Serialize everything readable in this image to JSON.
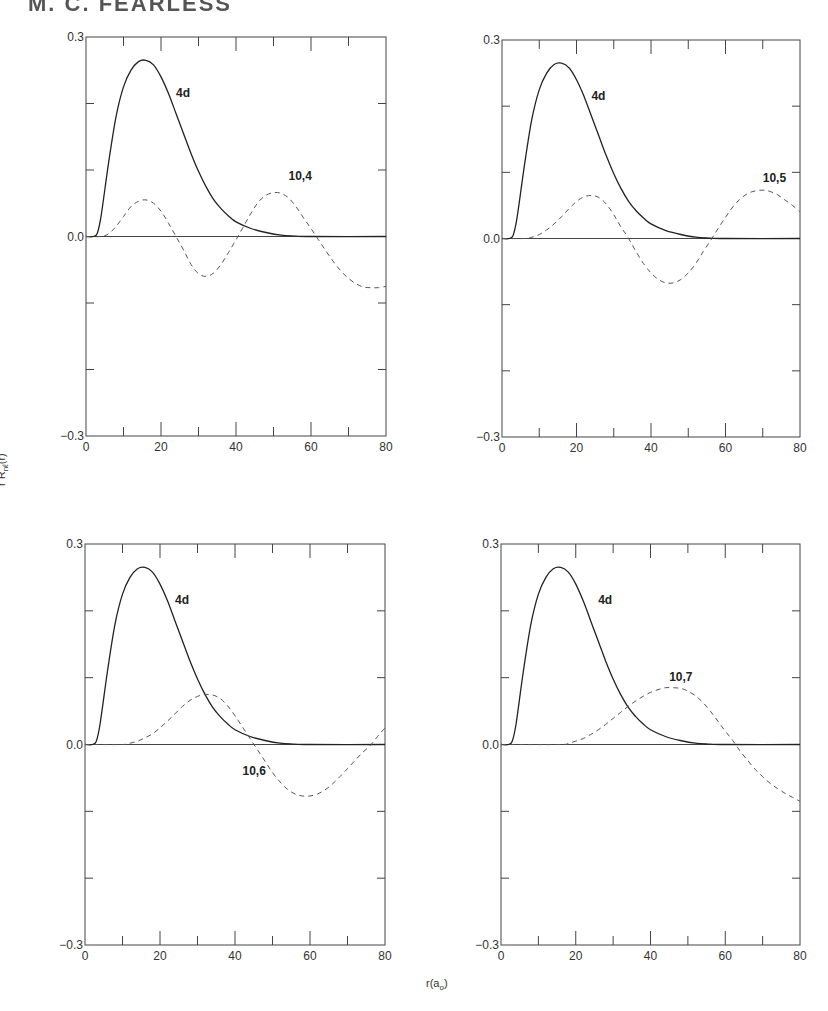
{
  "page": {
    "header_cropped_text": "M. C. FEARLESS"
  },
  "axes": {
    "ylabel": "r R",
    "ylabel_sub": "nℓ",
    "ylabel_tail": "(r)",
    "xlabel": "r(a",
    "xlabel_sub": "o",
    "xlabel_tail": ")"
  },
  "chart_data": [
    {
      "type": "line",
      "panel": "top-left",
      "xlabel": "r(a_o)",
      "ylabel": "r R_nl(r)",
      "xlim": [
        0,
        80
      ],
      "ylim": [
        -0.3,
        0.3
      ],
      "xticks": [
        0,
        20,
        40,
        60,
        80
      ],
      "yticks": [
        -0.3,
        0.0,
        0.3
      ],
      "series": [
        {
          "name": "4d",
          "style": "solid",
          "x": [
            0,
            2,
            3,
            4,
            6,
            8,
            10,
            12,
            14,
            16,
            18,
            20,
            22,
            24,
            26,
            28,
            30,
            32,
            34,
            36,
            38,
            40,
            44,
            48,
            52,
            56,
            60,
            80
          ],
          "y": [
            0,
            0,
            0.005,
            0.03,
            0.11,
            0.18,
            0.225,
            0.25,
            0.263,
            0.265,
            0.258,
            0.24,
            0.215,
            0.185,
            0.155,
            0.125,
            0.098,
            0.075,
            0.056,
            0.042,
            0.031,
            0.022,
            0.012,
            0.006,
            0.002,
            0.0005,
            0,
            0
          ]
        },
        {
          "name": "10,4",
          "style": "dashed",
          "x": [
            0,
            4,
            6,
            8,
            10,
            12,
            14,
            16,
            18,
            20,
            22,
            24,
            26,
            28,
            30,
            32,
            34,
            36,
            38,
            40,
            42,
            44,
            46,
            48,
            50,
            52,
            54,
            56,
            58,
            60,
            62,
            64,
            66,
            68,
            70,
            72,
            74,
            76,
            78,
            80
          ],
          "y": [
            0,
            0,
            0.004,
            0.015,
            0.03,
            0.045,
            0.053,
            0.055,
            0.05,
            0.038,
            0.02,
            0,
            -0.02,
            -0.042,
            -0.056,
            -0.06,
            -0.055,
            -0.042,
            -0.024,
            -0.005,
            0.015,
            0.035,
            0.052,
            0.062,
            0.066,
            0.065,
            0.058,
            0.045,
            0.028,
            0.012,
            -0.005,
            -0.022,
            -0.038,
            -0.052,
            -0.063,
            -0.071,
            -0.076,
            -0.077,
            -0.077,
            -0.075
          ]
        }
      ],
      "annotations": [
        {
          "text": "4d",
          "x": 24,
          "y": 0.21
        },
        {
          "text": "10,4",
          "x": 54,
          "y": 0.085
        }
      ]
    },
    {
      "type": "line",
      "panel": "top-right",
      "xlim": [
        0,
        80
      ],
      "ylim": [
        -0.3,
        0.3
      ],
      "xticks": [
        0,
        20,
        40,
        60,
        80
      ],
      "yticks": [
        -0.3,
        0.0,
        0.3
      ],
      "series": [
        {
          "name": "4d",
          "style": "solid",
          "x": [
            0,
            2,
            3,
            4,
            6,
            8,
            10,
            12,
            14,
            16,
            18,
            20,
            22,
            24,
            26,
            28,
            30,
            32,
            34,
            36,
            38,
            40,
            44,
            48,
            52,
            56,
            60,
            80
          ],
          "y": [
            0,
            0,
            0.005,
            0.03,
            0.11,
            0.18,
            0.225,
            0.25,
            0.263,
            0.265,
            0.258,
            0.24,
            0.215,
            0.185,
            0.155,
            0.125,
            0.098,
            0.075,
            0.056,
            0.042,
            0.031,
            0.022,
            0.012,
            0.006,
            0.002,
            0.0005,
            0,
            0
          ]
        },
        {
          "name": "10,5",
          "style": "dashed",
          "x": [
            0,
            6,
            8,
            10,
            12,
            14,
            16,
            18,
            20,
            22,
            24,
            26,
            28,
            30,
            32,
            34,
            36,
            38,
            40,
            42,
            44,
            46,
            48,
            50,
            52,
            54,
            56,
            58,
            60,
            62,
            64,
            66,
            68,
            70,
            72,
            74,
            76,
            78,
            80
          ],
          "y": [
            0,
            0,
            0.002,
            0.006,
            0.013,
            0.022,
            0.033,
            0.045,
            0.056,
            0.063,
            0.065,
            0.062,
            0.052,
            0.036,
            0.017,
            0,
            -0.02,
            -0.038,
            -0.052,
            -0.062,
            -0.067,
            -0.067,
            -0.062,
            -0.052,
            -0.038,
            -0.02,
            -0.003,
            0.015,
            0.032,
            0.048,
            0.06,
            0.068,
            0.072,
            0.073,
            0.071,
            0.066,
            0.058,
            0.05,
            0.04
          ]
        }
      ],
      "annotations": [
        {
          "text": "4d",
          "x": 24,
          "y": 0.21
        },
        {
          "text": "10,5",
          "x": 70,
          "y": 0.085
        }
      ]
    },
    {
      "type": "line",
      "panel": "bottom-left",
      "xlim": [
        0,
        80
      ],
      "ylim": [
        -0.3,
        0.3
      ],
      "xticks": [
        0,
        20,
        40,
        60,
        80
      ],
      "yticks": [
        -0.3,
        0.0,
        0.3
      ],
      "series": [
        {
          "name": "4d",
          "style": "solid",
          "x": [
            0,
            2,
            3,
            4,
            6,
            8,
            10,
            12,
            14,
            16,
            18,
            20,
            22,
            24,
            26,
            28,
            30,
            32,
            34,
            36,
            38,
            40,
            44,
            48,
            52,
            56,
            60,
            80
          ],
          "y": [
            0,
            0,
            0.005,
            0.03,
            0.11,
            0.18,
            0.225,
            0.25,
            0.263,
            0.265,
            0.258,
            0.24,
            0.215,
            0.185,
            0.155,
            0.125,
            0.098,
            0.075,
            0.056,
            0.042,
            0.031,
            0.022,
            0.012,
            0.006,
            0.002,
            0.0005,
            0,
            0
          ]
        },
        {
          "name": "10,6",
          "style": "dashed",
          "x": [
            0,
            10,
            12,
            14,
            16,
            18,
            20,
            22,
            24,
            26,
            28,
            30,
            32,
            34,
            36,
            38,
            40,
            42,
            44,
            46,
            48,
            50,
            52,
            54,
            56,
            58,
            60,
            62,
            64,
            66,
            68,
            70,
            72,
            74,
            76,
            78,
            80
          ],
          "y": [
            0,
            0,
            0.002,
            0.005,
            0.01,
            0.016,
            0.025,
            0.035,
            0.046,
            0.057,
            0.066,
            0.072,
            0.075,
            0.074,
            0.069,
            0.058,
            0.043,
            0.026,
            0.009,
            -0.008,
            -0.025,
            -0.042,
            -0.056,
            -0.067,
            -0.074,
            -0.077,
            -0.077,
            -0.074,
            -0.068,
            -0.059,
            -0.048,
            -0.036,
            -0.024,
            -0.012,
            -0.002,
            0.012,
            0.025
          ]
        }
      ],
      "annotations": [
        {
          "text": "4d",
          "x": 24,
          "y": 0.21
        },
        {
          "text": "10,6",
          "x": 42,
          "y": -0.045
        }
      ]
    },
    {
      "type": "line",
      "panel": "bottom-right",
      "xlim": [
        0,
        80
      ],
      "ylim": [
        -0.3,
        0.3
      ],
      "xticks": [
        0,
        20,
        40,
        60,
        80
      ],
      "yticks": [
        -0.3,
        0.0,
        0.3
      ],
      "series": [
        {
          "name": "4d",
          "style": "solid",
          "x": [
            0,
            2,
            3,
            4,
            6,
            8,
            10,
            12,
            14,
            16,
            18,
            20,
            22,
            24,
            26,
            28,
            30,
            32,
            34,
            36,
            38,
            40,
            44,
            48,
            52,
            56,
            60,
            80
          ],
          "y": [
            0,
            0,
            0.005,
            0.03,
            0.11,
            0.18,
            0.225,
            0.25,
            0.263,
            0.265,
            0.258,
            0.24,
            0.215,
            0.185,
            0.155,
            0.125,
            0.098,
            0.075,
            0.056,
            0.042,
            0.031,
            0.022,
            0.012,
            0.006,
            0.002,
            0.0005,
            0,
            0
          ]
        },
        {
          "name": "10,7",
          "style": "dashed",
          "x": [
            0,
            16,
            18,
            20,
            22,
            24,
            26,
            28,
            30,
            32,
            34,
            36,
            38,
            40,
            42,
            44,
            46,
            48,
            50,
            52,
            54,
            56,
            58,
            60,
            62,
            64,
            66,
            68,
            70,
            72,
            74,
            76,
            78,
            80
          ],
          "y": [
            0,
            0,
            0.002,
            0.005,
            0.009,
            0.015,
            0.022,
            0.03,
            0.039,
            0.048,
            0.057,
            0.065,
            0.072,
            0.078,
            0.082,
            0.085,
            0.085,
            0.084,
            0.08,
            0.073,
            0.063,
            0.05,
            0.035,
            0.02,
            0.006,
            -0.01,
            -0.024,
            -0.037,
            -0.048,
            -0.058,
            -0.066,
            -0.073,
            -0.079,
            -0.085
          ]
        }
      ],
      "annotations": [
        {
          "text": "4d",
          "x": 26,
          "y": 0.21
        },
        {
          "text": "10,7",
          "x": 45,
          "y": 0.095
        }
      ]
    }
  ]
}
